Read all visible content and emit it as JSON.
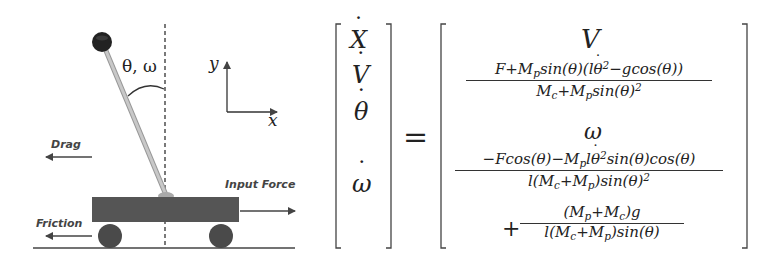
{
  "diagram": {
    "labels": {
      "angle": "θ, ω",
      "axis_y": "y",
      "axis_x": "x",
      "drag": "Drag",
      "input_force": "Input Force",
      "friction": "Friction"
    },
    "colors": {
      "cart": "#555555",
      "wheel": "#4a4a4a",
      "rod": "#bdbdbd",
      "ball": "#222222",
      "line": "#333333"
    }
  },
  "equation": {
    "lhs": [
      "X",
      "V",
      "θ",
      "ω"
    ],
    "equals": "=",
    "rhs": {
      "row1": "V",
      "row2": {
        "numerator": "F+M_p sin(θ)(l θ̇² − g cos(θ))",
        "denominator": "M_c+M_p sin(θ)²"
      },
      "row3": "ω",
      "row4": {
        "numerator": "−F cos(θ)−M_p l θ̇² sin(θ)cos(θ)",
        "denominator": "l(M_c+M_p) sin(θ)²"
      },
      "row5": {
        "prefix": "+",
        "numerator": "(M_p+M_c)g",
        "denominator": "l(M_c+M_p) sin(θ)"
      }
    }
  }
}
